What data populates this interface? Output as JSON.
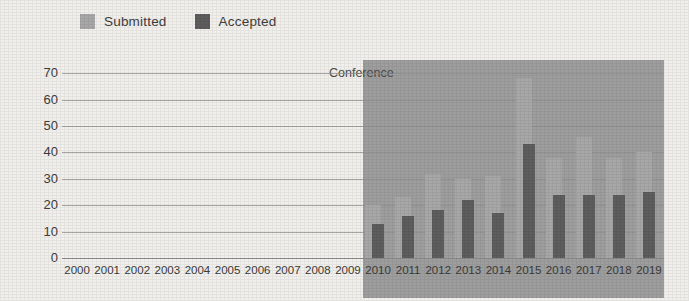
{
  "legend": {
    "entries": [
      {
        "label": "Submitted",
        "color": "#a8a8a8",
        "icon": "legend-swatch-submitted"
      },
      {
        "label": "Accepted",
        "color": "#5e5e5e",
        "icon": "legend-swatch-accepted"
      }
    ]
  },
  "annotation": {
    "conference_label": "Conference",
    "shade_color": "#9e9e9e"
  },
  "chart_data": {
    "type": "bar",
    "title": "",
    "subtitle": "",
    "xlabel": "",
    "ylabel": "",
    "ylim": [
      0,
      75
    ],
    "yticks": [
      0,
      10,
      20,
      30,
      40,
      50,
      60,
      70
    ],
    "grid": true,
    "legend_position": "top-left",
    "categories": [
      "2000",
      "2001",
      "2002",
      "2003",
      "2004",
      "2005",
      "2006",
      "2007",
      "2008",
      "2009",
      "2010",
      "2011",
      "2012",
      "2013",
      "2014",
      "2015",
      "2016",
      "2017",
      "2018",
      "2019"
    ],
    "series": [
      {
        "name": "Submitted",
        "color": "#a8a8a8",
        "values": [
          null,
          null,
          null,
          null,
          null,
          null,
          null,
          null,
          null,
          null,
          20,
          23,
          32,
          30,
          31,
          68,
          38,
          46,
          38,
          40
        ]
      },
      {
        "name": "Accepted",
        "color": "#5e5e5e",
        "values": [
          null,
          null,
          null,
          null,
          null,
          null,
          null,
          null,
          null,
          null,
          13,
          16,
          18,
          22,
          17,
          43,
          24,
          24,
          24,
          25
        ]
      }
    ],
    "annotations": [
      {
        "text": "Conference",
        "type": "region-label",
        "span": [
          "2010",
          "2019"
        ]
      }
    ]
  }
}
